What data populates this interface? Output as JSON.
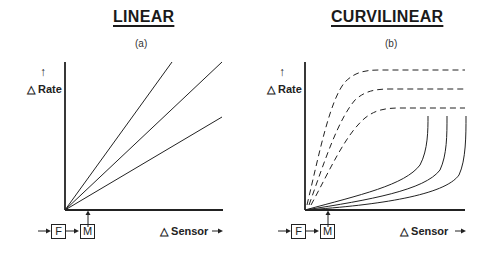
{
  "panels": [
    {
      "title": "LINEAR",
      "subtitle": "(a)",
      "y_label": "△ Rate",
      "x_label": "△ Sensor",
      "flow_boxes": [
        "F",
        "M"
      ]
    },
    {
      "title": "CURVILINEAR",
      "subtitle": "(b)",
      "y_label": "△ Rate",
      "x_label": "△ Sensor",
      "flow_boxes": [
        "F",
        "M"
      ]
    }
  ],
  "arrows": {
    "up": "↑",
    "right": "→"
  }
}
